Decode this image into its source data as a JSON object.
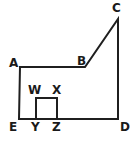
{
  "figure": {
    "stroke_color": "#1f1f1f",
    "label_color": "#1a1a1a",
    "background_color": "#ffffff",
    "stroke_width": 2,
    "canvas": {
      "width": 137,
      "height": 142
    },
    "outer_path": "M 20 67 L 85 67 L 118 19 L 118 119 L 19 119 Z",
    "inner_path": "M 36 119 L 36 98 L 57 98 L 57 119",
    "vertices": [
      {
        "id": "A",
        "label": "A",
        "x": 20,
        "y": 67,
        "label_x": 9,
        "label_y": 57
      },
      {
        "id": "B",
        "label": "B",
        "x": 85,
        "y": 67,
        "label_x": 77,
        "label_y": 55
      },
      {
        "id": "C",
        "label": "C",
        "x": 118,
        "y": 19,
        "label_x": 112,
        "label_y": 2
      },
      {
        "id": "D",
        "label": "D",
        "x": 118,
        "y": 119,
        "label_x": 120,
        "label_y": 121
      },
      {
        "id": "E",
        "label": "E",
        "x": 19,
        "y": 119,
        "label_x": 9,
        "label_y": 121
      },
      {
        "id": "W",
        "label": "W",
        "x": 36,
        "y": 98,
        "label_x": 28,
        "label_y": 84
      },
      {
        "id": "X",
        "label": "X",
        "x": 57,
        "y": 98,
        "label_x": 52,
        "label_y": 84
      },
      {
        "id": "Y",
        "label": "Y",
        "x": 36,
        "y": 119,
        "label_x": 31,
        "label_y": 121
      },
      {
        "id": "Z",
        "label": "Z",
        "x": 57,
        "y": 119,
        "label_x": 52,
        "label_y": 121
      }
    ],
    "edges": [
      {
        "from": "A",
        "to": "B",
        "kind": "horizontal"
      },
      {
        "from": "B",
        "to": "C",
        "kind": "diagonal"
      },
      {
        "from": "C",
        "to": "D",
        "kind": "vertical"
      },
      {
        "from": "D",
        "to": "E",
        "kind": "horizontal"
      },
      {
        "from": "E",
        "to": "A",
        "kind": "vertical"
      },
      {
        "from": "Y",
        "to": "W",
        "kind": "vertical"
      },
      {
        "from": "W",
        "to": "X",
        "kind": "horizontal"
      },
      {
        "from": "X",
        "to": "Z",
        "kind": "vertical"
      }
    ]
  }
}
